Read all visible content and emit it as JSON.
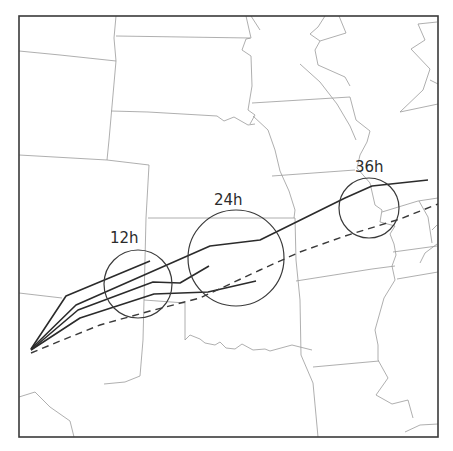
{
  "map": {
    "type": "forecast-track-map",
    "region": "Central United States",
    "frame": {
      "x": 19,
      "y": 16,
      "width": 419,
      "height": 421
    },
    "colors": {
      "frame": "#3a3a3a",
      "state_borders": "#9a9a9a",
      "tracks": "#2b2b2b",
      "background": "#ffffff"
    }
  },
  "uncertainty_circles": [
    {
      "id": "12h",
      "label": "12h",
      "cx": 138,
      "cy": 284,
      "r": 34,
      "label_x": 110,
      "label_y": 243
    },
    {
      "id": "24h",
      "label": "24h",
      "cx": 236,
      "cy": 258,
      "r": 48,
      "label_x": 214,
      "label_y": 205
    },
    {
      "id": "36h",
      "label": "36h",
      "cx": 369,
      "cy": 208,
      "r": 30,
      "label_x": 355,
      "label_y": 172
    }
  ],
  "tracks": {
    "origin": {
      "x": 31,
      "y": 350
    },
    "solid": [
      {
        "name": "track-1",
        "points": "31,349 66,296 150,261"
      },
      {
        "name": "track-2",
        "points": "31,349 76,305 210,246 260,240 345,198 372,186 428,180"
      },
      {
        "name": "track-3",
        "points": "31,350 78,310 153,282 180,283 209,266"
      },
      {
        "name": "track-4",
        "points": "31,350 80,318 154,294 208,292 256,281"
      }
    ],
    "dashed": {
      "name": "track-dashed",
      "points": "31,353 60,341 100,325 150,311 200,298 260,270 300,252 345,236 400,219 438,204"
    }
  },
  "state_borders": [
    "M 19,51 L 60,55 L 116,61",
    "M 116,16 L 114,38 L 116,61 L 109,140 L 107,160",
    "M 116,36 L 250,38",
    "M 19,155 L 107,160 L 149,165 L 146,218 L 144,300 L 143,340 L 140,376 L 125,382 L 104,384",
    "M 111,111 L 148,112 L 217,116 L 224,121 L 234,117 L 248,125 L 255,124",
    "M 148,218 L 275,218",
    "M 144,300 L 185,303 L 185,340",
    "M 185,340 L 190,335 L 200,339 L 205,343 L 215,345 L 220,342 L 226,348 L 235,349 L 242,344 L 253,350 L 265,349 L 270,351 L 292,345 L 312,350",
    "M 19,293 L 62,298",
    "M 19,397 L 35,392 L 50,407 L 70,421 L 74,437",
    "M 246,16 L 251,38 L 246,39 L 242,50 L 251,56 L 252,86 L 248,110 L 255,115 L 250,124",
    "M 253,116 L 268,130 L 275,150 L 280,171 L 289,191 L 295,210 L 294,218",
    "M 252,103 L 350,97",
    "M 251,16 L 260,30",
    "M 325,16 L 318,27 L 310,34 L 320,41 L 346,33 L 339,16",
    "M 320,41 L 315,50 L 318,65 L 345,77 L 350,86",
    "M 300,64 L 320,82 L 337,104 L 350,126 L 356,140",
    "M 350,97 L 356,120 L 370,131 L 367,142 L 360,155 L 357,168",
    "M 272,176 L 355,170",
    "M 275,218 L 295,218 L 296,260 L 300,300 L 301,355",
    "M 296,281 L 372,269",
    "M 301,355 L 313,383 L 318,437",
    "M 313,367 L 379,361",
    "M 357,168 L 370,183 L 375,205 L 382,210 L 380,222 L 395,226 L 390,234 L 394,244 L 396,255 L 392,266 L 395,280 L 384,298 L 375,330 L 378,345 L 378,360 L 388,378 L 376,395 L 392,404 L 408,400 L 413,418",
    "M 382,212 L 418,201 L 438,198",
    "M 397,279 L 438,272",
    "M 393,252 L 437,246",
    "M 419,201 L 428,217 L 432,243",
    "M 437,244 L 425,253 L 420,263",
    "M 400,112 L 438,104",
    "M 400,112 L 423,90 L 430,69 L 411,49 L 425,40 L 418,24 L 437,22",
    "M 430,80 L 438,84",
    "M 432,230 L 437,225",
    "M 405,432 L 420,425 L 438,424",
    "M 372,269 L 395,266"
  ]
}
